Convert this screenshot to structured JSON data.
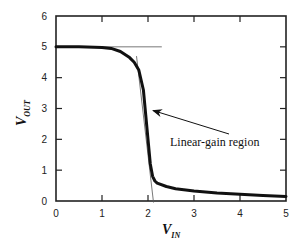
{
  "chart_data": {
    "type": "line",
    "title": "",
    "xlabel": "V_IN",
    "ylabel": "V_OUT",
    "xlabel_main": "V",
    "xlabel_sub": "IN",
    "ylabel_main": "V",
    "ylabel_sub": "OUT",
    "xlim": [
      0,
      5
    ],
    "ylim": [
      0,
      6
    ],
    "xticks": [
      "0",
      "1",
      "2",
      "3",
      "4",
      "5"
    ],
    "yticks": [
      "0",
      "1",
      "2",
      "3",
      "4",
      "5",
      "6"
    ],
    "grid": false,
    "legend": null,
    "series": [
      {
        "name": "Inverter transfer characteristic",
        "x": [
          0,
          0.5,
          1.0,
          1.2,
          1.4,
          1.6,
          1.7,
          1.8,
          1.9,
          1.95,
          2.0,
          2.05,
          2.1,
          2.15,
          2.2,
          2.4,
          2.6,
          3.0,
          3.5,
          4.0,
          4.5,
          5.0
        ],
        "y": [
          5.0,
          5.0,
          4.98,
          4.95,
          4.85,
          4.65,
          4.5,
          4.25,
          3.6,
          2.8,
          2.0,
          1.2,
          0.8,
          0.65,
          0.58,
          0.47,
          0.4,
          0.32,
          0.26,
          0.22,
          0.18,
          0.15
        ]
      }
    ],
    "reference_lines": [
      {
        "name": "high-output tangent",
        "orientation": "horizontal",
        "y": 5.0,
        "x_range": [
          0,
          2.3
        ]
      },
      {
        "name": "linear-gain tangent",
        "orientation": "steep",
        "points": [
          [
            1.75,
            4.7
          ],
          [
            2.12,
            -0.05
          ]
        ]
      }
    ],
    "annotations": [
      {
        "text": "Linear-gain region",
        "arrow_to": [
          2.0,
          3.0
        ],
        "text_pos": [
          3.0,
          1.65
        ]
      }
    ]
  }
}
